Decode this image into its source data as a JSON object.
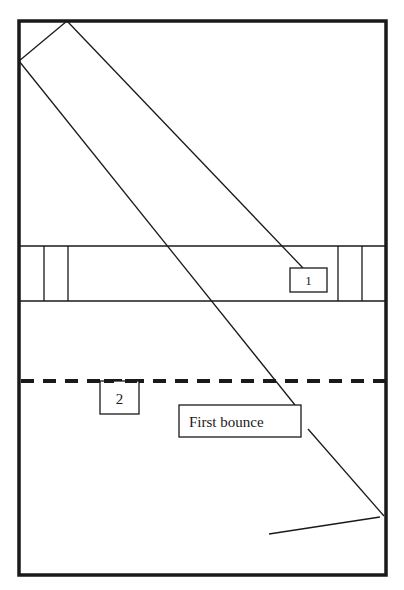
{
  "diagram": {
    "title": "",
    "colors": {
      "stroke": "#1a1a1a",
      "background": "#ffffff"
    },
    "court": {
      "frame": {
        "x1": 19,
        "y1": 21,
        "x2": 386,
        "y2": 575,
        "stroke_width": 3.5
      },
      "band": {
        "y_top": 246,
        "y_bottom": 301
      },
      "band_left_dividers": [
        44,
        68
      ],
      "band_right_dividers": [
        338,
        362
      ],
      "dashed_line": {
        "y": 381,
        "x1": 19,
        "x2": 386
      }
    },
    "labels": {
      "box1": {
        "text": "1",
        "x": 290,
        "y": 268,
        "w": 37,
        "h": 24
      },
      "box2": {
        "text": "2",
        "x": 100,
        "y": 381,
        "w": 39,
        "h": 33
      },
      "first_bounce": {
        "text": "First bounce",
        "x": 179,
        "y": 405,
        "w": 122,
        "h": 32
      }
    },
    "paths": [
      {
        "name": "corner-segment",
        "x1": 67,
        "y1": 21,
        "x2": 19,
        "y2": 61
      },
      {
        "name": "path-to-box1",
        "x1": 67,
        "y1": 21,
        "x2": 303,
        "y2": 268
      },
      {
        "name": "path-to-first-bounce",
        "x1": 19,
        "y1": 61,
        "x2": 295,
        "y2": 405
      },
      {
        "name": "after-bounce-segment",
        "x1": 308,
        "y1": 429,
        "x2": 384,
        "y2": 516
      },
      {
        "name": "rebound-segment",
        "x1": 380,
        "y1": 517,
        "x2": 269,
        "y2": 534
      }
    ]
  }
}
